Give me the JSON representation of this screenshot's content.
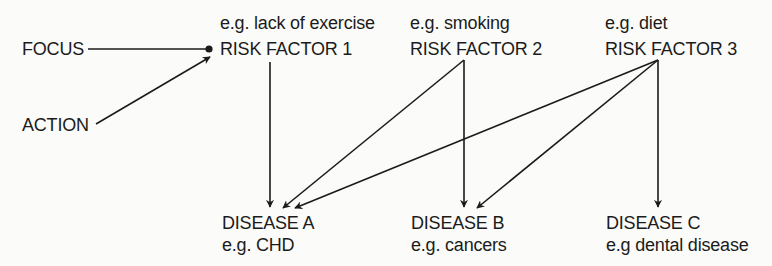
{
  "diagram": {
    "inputs": [
      {
        "id": "focus",
        "label": "FOCUS"
      },
      {
        "id": "action",
        "label": "ACTION"
      }
    ],
    "risk_factors": [
      {
        "id": "rf1",
        "label": "RISK FACTOR 1",
        "example": "e.g. lack of exercise"
      },
      {
        "id": "rf2",
        "label": "RISK FACTOR 2",
        "example": "e.g. smoking"
      },
      {
        "id": "rf3",
        "label": "RISK FACTOR 3",
        "example": "e.g. diet"
      }
    ],
    "diseases": [
      {
        "id": "da",
        "label": "DISEASE A",
        "example": "e.g. CHD"
      },
      {
        "id": "db",
        "label": "DISEASE B",
        "example": "e.g. cancers"
      },
      {
        "id": "dc",
        "label": "DISEASE C",
        "example": "e.g dental disease"
      }
    ],
    "edges": [
      {
        "from": "focus",
        "to": "rf1",
        "style": "line-to-dot"
      },
      {
        "from": "action",
        "to": "rf1",
        "style": "arrow"
      },
      {
        "from": "rf1",
        "to": "da",
        "style": "arrow"
      },
      {
        "from": "rf2",
        "to": "da",
        "style": "arrow"
      },
      {
        "from": "rf2",
        "to": "db",
        "style": "arrow"
      },
      {
        "from": "rf3",
        "to": "da",
        "style": "arrow"
      },
      {
        "from": "rf3",
        "to": "db",
        "style": "arrow"
      },
      {
        "from": "rf3",
        "to": "dc",
        "style": "arrow"
      }
    ],
    "colors": {
      "line": "#1b1b1b",
      "background": "#fbfbf9"
    }
  }
}
